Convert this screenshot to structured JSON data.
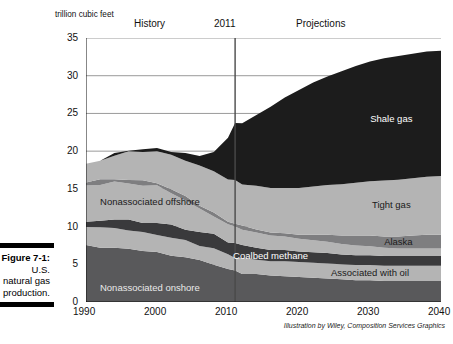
{
  "caption": {
    "figure_number": "Figure 7-1:",
    "line2": "U.S.",
    "line3": "natural gas",
    "line4": "production."
  },
  "credit": "Illustration by Wiley, Composition Services Graphics",
  "chart_data": {
    "type": "area",
    "stacked": true,
    "title": "",
    "subtitle": "",
    "ylabel": "trillion cubic feet",
    "xlabel": "",
    "ylim": [
      0,
      35
    ],
    "xlim": [
      1990,
      2040
    ],
    "yticks": [
      0,
      5,
      10,
      15,
      20,
      25,
      30,
      35
    ],
    "xticks": [
      1990,
      2000,
      2010,
      2020,
      2030,
      2040
    ],
    "grid": "horizontal",
    "legend_position": "inline-annotations",
    "annotations": [
      {
        "text": "History",
        "x": 1999,
        "role": "period-label"
      },
      {
        "text": "2011",
        "x": 2011,
        "role": "divider-label"
      },
      {
        "text": "Projections",
        "x": 2026,
        "role": "period-label"
      }
    ],
    "divider_year": 2011,
    "x": [
      1990,
      1992,
      1994,
      1996,
      1998,
      2000,
      2002,
      2004,
      2006,
      2008,
      2010,
      2011,
      2012,
      2014,
      2016,
      2018,
      2020,
      2022,
      2024,
      2026,
      2028,
      2030,
      2032,
      2034,
      2036,
      2038,
      2040
    ],
    "series": [
      {
        "name": "Nonassociated onshore",
        "color": "#59595b",
        "label_color": "#e9e9e9",
        "values": [
          7.4,
          7.3,
          7.2,
          7.0,
          6.8,
          6.6,
          6.2,
          5.9,
          5.5,
          5.1,
          4.3,
          4.1,
          3.9,
          3.7,
          3.5,
          3.4,
          3.3,
          3.2,
          3.1,
          3.0,
          2.9,
          2.9,
          2.8,
          2.8,
          2.8,
          2.8,
          2.8
        ]
      },
      {
        "name": "Associated with oil",
        "color": "#b4b4b4",
        "label_color": "#1a1a1a",
        "values": [
          2.6,
          2.6,
          2.6,
          2.5,
          2.4,
          2.4,
          2.3,
          2.2,
          2.1,
          2.0,
          1.9,
          1.9,
          1.9,
          1.9,
          1.9,
          2.0,
          2.0,
          2.0,
          2.0,
          2.0,
          2.0,
          2.0,
          2.0,
          2.0,
          2.0,
          2.0,
          2.0
        ]
      },
      {
        "name": "Coalbed methane",
        "color": "#3a3a3c",
        "label_color": "#ffffff",
        "values": [
          0.6,
          0.9,
          1.2,
          1.3,
          1.4,
          1.5,
          1.6,
          1.6,
          1.7,
          1.8,
          1.8,
          1.8,
          1.7,
          1.6,
          1.5,
          1.5,
          1.4,
          1.4,
          1.4,
          1.3,
          1.3,
          1.3,
          1.3,
          1.3,
          1.3,
          1.3,
          1.3
        ]
      },
      {
        "name": "Nonassociated offshore",
        "color": "#b4b4b4",
        "label_color": "#1a1a1a",
        "values": [
          4.9,
          4.8,
          4.8,
          5.0,
          4.9,
          4.8,
          4.4,
          3.8,
          3.0,
          2.5,
          2.3,
          2.2,
          2.1,
          2.0,
          1.9,
          1.8,
          1.7,
          1.6,
          1.5,
          1.4,
          1.3,
          1.2,
          1.1,
          1.0,
          1.0,
          1.0,
          1.0
        ]
      },
      {
        "name": "Alaska",
        "color": "#7e7e80",
        "label_color": "#1a1a1a",
        "values": [
          0.5,
          0.5,
          0.5,
          0.5,
          0.5,
          0.5,
          0.5,
          0.5,
          0.5,
          0.4,
          0.4,
          0.4,
          0.4,
          0.4,
          0.4,
          0.4,
          0.5,
          0.7,
          0.9,
          1.1,
          1.3,
          1.4,
          1.5,
          1.6,
          1.7,
          1.8,
          1.8
        ]
      },
      {
        "name": "Tight gas",
        "color": "#b4b4b4",
        "label_color": "#1a1a1a",
        "values": [
          2.2,
          2.6,
          3.2,
          3.6,
          3.9,
          4.2,
          4.5,
          4.8,
          5.2,
          5.6,
          5.6,
          5.6,
          5.7,
          5.8,
          5.9,
          6.0,
          6.2,
          6.4,
          6.6,
          6.8,
          7.0,
          7.2,
          7.4,
          7.5,
          7.6,
          7.7,
          7.8
        ]
      },
      {
        "name": "Shale gas",
        "color": "#1c1c1c",
        "label_color": "#ffffff",
        "values": [
          0.1,
          0.1,
          0.2,
          0.2,
          0.3,
          0.4,
          0.5,
          0.8,
          1.4,
          2.6,
          5.3,
          7.8,
          8.1,
          9.4,
          10.8,
          12.0,
          13.0,
          13.8,
          14.4,
          15.0,
          15.5,
          15.9,
          16.2,
          16.4,
          16.5,
          16.6,
          16.6
        ]
      }
    ],
    "inline_labels": [
      {
        "text": "Shale gas",
        "series": "Shale gas"
      },
      {
        "text": "Tight gas",
        "series": "Tight gas"
      },
      {
        "text": "Alaska",
        "series": "Alaska"
      },
      {
        "text": "Associated with oil",
        "series": "Associated with oil"
      },
      {
        "text": "Coalbed methane",
        "series": "Coalbed methane"
      },
      {
        "text": "Nonassociated offshore",
        "series": "Nonassociated offshore"
      },
      {
        "text": "Nonassociated onshore",
        "series": "Nonassociated onshore"
      }
    ]
  }
}
